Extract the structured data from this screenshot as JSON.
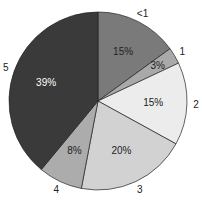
{
  "chart_data": {
    "type": "pie",
    "title": "",
    "categories": [
      "<1",
      "1",
      "2",
      "3",
      "4",
      "5"
    ],
    "values": [
      15,
      3,
      15,
      20,
      8,
      39
    ],
    "value_labels": [
      "15%",
      "3%",
      "15%",
      "20%",
      "8%",
      "39%"
    ],
    "colors": [
      "#7a7a7a",
      "#a9a9a9",
      "#ececec",
      "#d2d2d2",
      "#acacac",
      "#3a3a3a"
    ],
    "label_colors": [
      "#222222",
      "#222222",
      "#222222",
      "#222222",
      "#222222",
      "#ffffff"
    ],
    "start_angle": "12 o'clock",
    "direction": "clockwise",
    "legend": "none"
  }
}
